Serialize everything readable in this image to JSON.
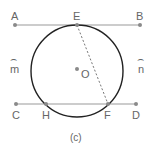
{
  "diagram": {
    "caption": "(c)",
    "colors": {
      "line": "#9a9a9a",
      "circle": "#222222",
      "point": "#8a8a8a",
      "label": "#666666",
      "dashed": "#777777"
    },
    "lines": [
      {
        "name": "AB",
        "from": "A",
        "to": "B"
      },
      {
        "name": "CD",
        "from": "C",
        "to": "D"
      }
    ],
    "points": {
      "A": {
        "label": "A"
      },
      "B": {
        "label": "B"
      },
      "E": {
        "label": "E"
      },
      "C": {
        "label": "C"
      },
      "D": {
        "label": "D"
      },
      "H": {
        "label": "H"
      },
      "F": {
        "label": "F"
      },
      "O": {
        "label": "O"
      }
    },
    "arcs": {
      "m": {
        "label": "m",
        "mark": "⌢"
      },
      "n": {
        "label": "n",
        "mark": "⌢"
      }
    },
    "circle": {
      "center": "O"
    },
    "segment_dashed": {
      "from": "E",
      "to": "F"
    }
  }
}
